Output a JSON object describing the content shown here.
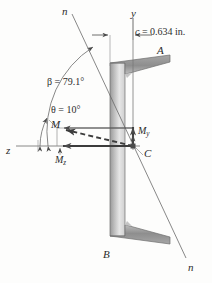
{
  "figure": {
    "background_color": "#fdfdfc",
    "line_color": "#4a4a4a",
    "section_fill_dark": "#8a8a8a",
    "section_fill_light": "#d8d8d8"
  },
  "labels": {
    "neutral_axis_top": "n",
    "neutral_axis_bottom": "n",
    "y_axis": "y",
    "z_axis": "z",
    "point_a": "A",
    "point_b": "B",
    "centroid": "C",
    "centroid_distance": "c = 0.634 in.",
    "centroid_distance_symbol": "c",
    "centroid_distance_value": "0.634 in.",
    "beta_angle": "β = 79.1°",
    "beta_symbol": "β",
    "beta_value": "79.1°",
    "theta_angle": "θ = 10°",
    "theta_symbol": "θ",
    "theta_value": "10°",
    "moment_resultant": "M",
    "moment_y_base": "M",
    "moment_y_sub": "y",
    "moment_z_base": "M",
    "moment_z_sub": "z"
  },
  "geometry": {
    "centroid_x": 133,
    "centroid_y": 146,
    "beta_degrees": 79.1,
    "theta_degrees": 10,
    "c_inches": 0.634
  },
  "vectors": [
    {
      "name": "M",
      "style": "dashed",
      "direction": "up-left",
      "label": "M"
    },
    {
      "name": "My",
      "style": "solid",
      "direction": "up",
      "label": "My"
    },
    {
      "name": "Mz",
      "style": "solid",
      "direction": "left",
      "label": "Mz"
    }
  ]
}
